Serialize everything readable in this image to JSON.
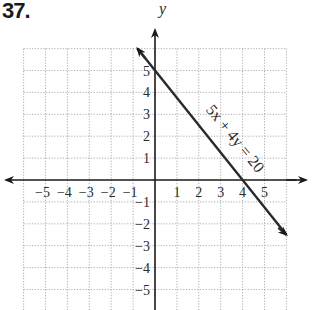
{
  "problem": {
    "number": "37."
  },
  "chart_data": {
    "type": "line",
    "title": "",
    "xlabel": "",
    "ylabel": "y",
    "xlim": [
      -6,
      6
    ],
    "ylim": [
      -6,
      6
    ],
    "grid": true,
    "x_ticks": [
      "-5",
      "-4",
      "-3",
      "-2",
      "-1",
      "1",
      "2",
      "3",
      "4",
      "5"
    ],
    "y_ticks": [
      "5",
      "4",
      "3",
      "2",
      "1",
      "-1",
      "-2",
      "-3",
      "-4",
      "-5"
    ],
    "series": [
      {
        "name": "5x + 4y = 20",
        "equation": "5x + 4y = 20",
        "x_intercept": 4,
        "y_intercept": 5,
        "points": [
          [
            -0.8,
            6
          ],
          [
            0,
            5
          ],
          [
            4,
            0
          ],
          [
            6,
            -2.5
          ]
        ]
      }
    ],
    "annotations": [
      {
        "text": "5x + 4y = 20",
        "position": [
          2.3,
          3.2
        ],
        "rotation": -51
      }
    ]
  },
  "labels": {
    "y_axis": "y",
    "equation": "5x + 4y = 20"
  }
}
